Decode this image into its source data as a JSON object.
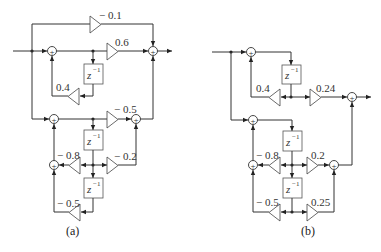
{
  "figure": {
    "diagrams": [
      {
        "id": "a",
        "caption": "(a)",
        "gains": {
          "top_feedforward": "− 0.1",
          "section1_forward": "0.6",
          "section1_feedback": "0.4",
          "section2_forward0": "− 0.5",
          "section2_feedback1": "− 0.8",
          "section2_forward1": "− 0.2",
          "section2_feedback2": "− 0.5"
        },
        "delays": [
          "z",
          "z",
          "z"
        ],
        "delay_exponent": "−1",
        "adder_symbol": "+"
      },
      {
        "id": "b",
        "caption": "(b)",
        "gains": {
          "section1_feedback": "0.4",
          "section1_forward": "0.24",
          "section2_feedback1": "− 0.8",
          "section2_forward1": "0.2",
          "section2_feedback2": "− 0.5",
          "section2_forward2": "0.25"
        },
        "delays": [
          "z",
          "z",
          "z"
        ],
        "delay_exponent": "−1",
        "adder_symbol": "+"
      }
    ]
  }
}
